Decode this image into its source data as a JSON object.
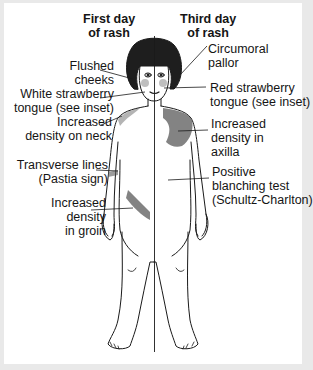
{
  "figure": {
    "left_header": "First day\nof rash",
    "right_header": "Third day\nof rash",
    "labels_left": [
      {
        "text": "Flushed\ncheeks"
      },
      {
        "text": "White strawberry\ntongue (see inset)"
      },
      {
        "text": "Increased\ndensity on neck"
      },
      {
        "text": "Transverse lines\n(Pastia sign)"
      },
      {
        "text": "Increased\ndensity\nin groin"
      }
    ],
    "labels_right": [
      {
        "text": "Circumoral\npallor"
      },
      {
        "text": "Red strawberry\ntongue (see inset)"
      },
      {
        "text": "Increased\ndensity in\naxilla"
      },
      {
        "text": "Positive\nblanching test\n(Schultz-Charlton)"
      }
    ],
    "colors": {
      "background": "#ffffff",
      "border": "#e9e9e9",
      "ink": "#151515",
      "rash_shading": "#5a5a5a"
    }
  }
}
